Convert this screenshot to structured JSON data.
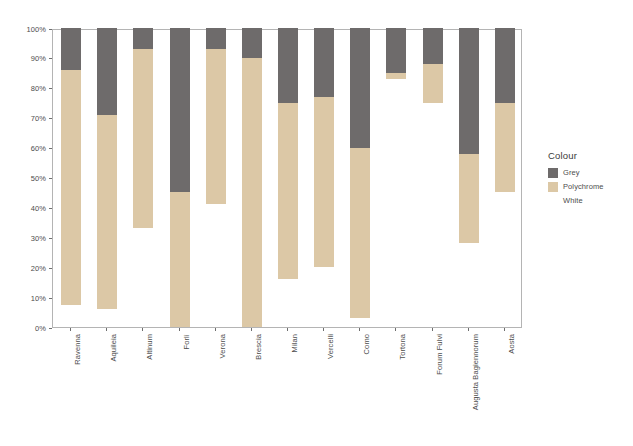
{
  "chart_data": {
    "type": "bar",
    "stacked": true,
    "stack_mode": "percent",
    "title": "",
    "subtitle": "",
    "xlabel": "",
    "ylabel": "",
    "ylim": [
      0,
      100
    ],
    "grid": false,
    "legend_position": "right",
    "categories": [
      "Ravenna",
      "Aquileia",
      "Altinum",
      "Forlì",
      "Verona",
      "Brescia",
      "Milan",
      "Vercelli",
      "Como",
      "Tortona",
      "Forum Fulvi",
      "Augusta Bagiennorum",
      "Aosta"
    ],
    "y_ticks": [
      0,
      10,
      20,
      30,
      40,
      50,
      60,
      70,
      80,
      90,
      100
    ],
    "y_tick_labels": [
      "0%",
      "10%",
      "20%",
      "30%",
      "40%",
      "50%",
      "60%",
      "70%",
      "80%",
      "90%",
      "100%"
    ],
    "series": [
      {
        "name": "Grey",
        "color": "#6e6b6b",
        "values": [
          14,
          29,
          7,
          55,
          7,
          10,
          25,
          23,
          40,
          15,
          12,
          42,
          25
        ]
      },
      {
        "name": "Polychrome",
        "color": "#dcc8a6",
        "values": [
          78.5,
          65,
          60,
          45,
          52,
          90,
          59,
          57,
          57,
          2,
          13,
          30,
          30
        ]
      },
      {
        "name": "White",
        "color": "#ffffff",
        "values": [
          7.5,
          6,
          33,
          0,
          41,
          0,
          16,
          20,
          3,
          83,
          75,
          28,
          45
        ]
      }
    ],
    "stack_boundaries_percent": [
      {
        "category": "Ravenna",
        "white_top": 7.5,
        "polychrome_top": 86
      },
      {
        "category": "Aquileia",
        "white_top": 6,
        "polychrome_top": 71
      },
      {
        "category": "Altinum",
        "white_top": 33,
        "polychrome_top": 93
      },
      {
        "category": "Forlì",
        "white_top": 0,
        "polychrome_top": 45
      },
      {
        "category": "Verona",
        "white_top": 41,
        "polychrome_top": 93
      },
      {
        "category": "Brescia",
        "white_top": 0,
        "polychrome_top": 90
      },
      {
        "category": "Milan",
        "white_top": 16,
        "polychrome_top": 75
      },
      {
        "category": "Vercelli",
        "white_top": 20,
        "polychrome_top": 77
      },
      {
        "category": "Como",
        "white_top": 3,
        "polychrome_top": 60
      },
      {
        "category": "Tortona",
        "white_top": 83,
        "polychrome_top": 85
      },
      {
        "category": "Forum Fulvi",
        "white_top": 75,
        "polychrome_top": 88
      },
      {
        "category": "Augusta Bagiennorum",
        "white_top": 28,
        "polychrome_top": 58
      },
      {
        "category": "Aosta",
        "white_top": 45,
        "polychrome_top": 75
      }
    ]
  },
  "legend": {
    "title": "Colour",
    "items": [
      {
        "label": "Grey",
        "color": "#6e6b6b"
      },
      {
        "label": "Polychrome",
        "color": "#dcc8a6"
      },
      {
        "label": "White",
        "color": "#ffffff"
      }
    ]
  },
  "axis": {
    "panel_border_color": "#b4b4b4",
    "tick_color": "#6e6e6e",
    "text_color": "#4d4d4d"
  }
}
